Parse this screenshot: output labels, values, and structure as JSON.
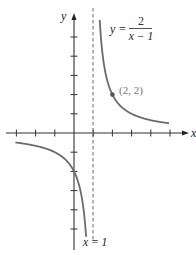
{
  "chart_data": {
    "type": "line",
    "title": "",
    "xlabel": "x",
    "ylabel": "y",
    "function": "y = 2/(x - 1)",
    "equation_label": {
      "lhs": "y =",
      "numerator": "2",
      "denominator": "x − 1"
    },
    "asymptote": {
      "type": "vertical",
      "x": 1,
      "label": "x = 1"
    },
    "highlighted_point": {
      "x": 2,
      "y": 2,
      "label": "(2, 2)"
    },
    "xlim": [
      -3.1,
      5.1
    ],
    "ylim": [
      -6,
      6
    ],
    "x_ticks": [
      -3,
      -2,
      -1,
      1,
      2,
      3,
      4,
      5
    ],
    "y_ticks": [
      -5,
      -4,
      -3,
      -2,
      -1,
      1,
      2,
      3,
      4,
      5
    ],
    "grid": false,
    "series": [
      {
        "name": "right branch",
        "x": [
          1.34,
          1.5,
          2,
          3,
          4,
          4.95
        ],
        "y": [
          5.9,
          4,
          2,
          1,
          0.67,
          0.51
        ]
      },
      {
        "name": "left branch",
        "x": [
          -3.05,
          -2,
          -1,
          0,
          0.5,
          0.63
        ],
        "y": [
          -0.49,
          -0.67,
          -1,
          -2,
          -4,
          -5.4
        ]
      }
    ],
    "axis_labels": {
      "x": "x",
      "y": "y"
    },
    "color": "#6b6b6b"
  }
}
